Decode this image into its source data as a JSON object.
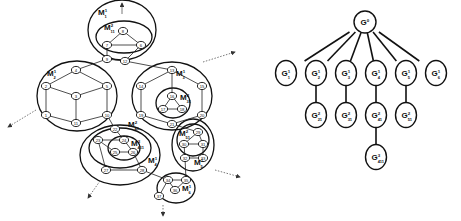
{
  "left_graph": {
    "regions": [
      {
        "id": "M1",
        "label": "M",
        "sup": "1",
        "sub": "1",
        "cx": 122,
        "cy": 30,
        "rx": 34,
        "ry": 30,
        "lx": 98,
        "ly": 15
      },
      {
        "id": "M11",
        "label": "M",
        "sup": "2",
        "sub": "11",
        "cx": 124,
        "cy": 37,
        "rx": 28,
        "ry": 16,
        "lx": 104,
        "ly": 30
      },
      {
        "id": "M2",
        "label": "M",
        "sup": "1",
        "sub": "2",
        "cx": 77,
        "cy": 96,
        "rx": 40,
        "ry": 35,
        "lx": 47,
        "ly": 76
      },
      {
        "id": "M3",
        "label": "M",
        "sup": "1",
        "sub": "3",
        "cx": 172,
        "cy": 96,
        "rx": 40,
        "ry": 34,
        "lx": 176,
        "ly": 76
      },
      {
        "id": "M31",
        "label": "M",
        "sup": "2",
        "sub": "31",
        "cx": 173,
        "cy": 103,
        "rx": 17,
        "ry": 15,
        "lx": 180,
        "ly": 100
      },
      {
        "id": "M4",
        "label": "M",
        "sup": "1",
        "sub": "4",
        "cx": 120,
        "cy": 155,
        "rx": 40,
        "ry": 30,
        "lx": 148,
        "ly": 163
      },
      {
        "id": "M41",
        "label": "M",
        "sup": "2",
        "sub": "41",
        "cx": 120,
        "cy": 148,
        "rx": 31,
        "ry": 20,
        "lx": 128,
        "ly": 127
      },
      {
        "id": "M411",
        "label": "M",
        "sup": "3",
        "sub": "411",
        "cx": 124,
        "cy": 148,
        "rx": 16,
        "ry": 12,
        "lx": 131,
        "ly": 146
      },
      {
        "id": "M5",
        "label": "M",
        "sup": "1",
        "sub": "5",
        "cx": 193,
        "cy": 145,
        "rx": 21,
        "ry": 26,
        "lx": 194,
        "ly": 165
      },
      {
        "id": "M51",
        "label": "M",
        "sup": "2",
        "sub": "51",
        "cx": 193,
        "cy": 140,
        "rx": 16,
        "ry": 16,
        "lx": 179,
        "ly": 136
      },
      {
        "id": "M6",
        "label": "M",
        "sup": "1",
        "sub": "6",
        "cx": 176,
        "cy": 188,
        "rx": 19,
        "ry": 15,
        "lx": 182,
        "ly": 191
      }
    ],
    "nodes": [
      {
        "id": "8",
        "x": 123,
        "y": 31
      },
      {
        "id": "7",
        "x": 107,
        "y": 45
      },
      {
        "id": "6",
        "x": 141,
        "y": 45
      },
      {
        "id": "9",
        "x": 107,
        "y": 59
      },
      {
        "id": "12",
        "x": 125,
        "y": 61
      },
      {
        "id": "4",
        "x": 76,
        "y": 70
      },
      {
        "id": "2",
        "x": 46,
        "y": 86
      },
      {
        "id": "5",
        "x": 107,
        "y": 86
      },
      {
        "id": "3",
        "x": 76,
        "y": 96
      },
      {
        "id": "1",
        "x": 46,
        "y": 115
      },
      {
        "id": "10",
        "x": 107,
        "y": 115
      },
      {
        "id": "11",
        "x": 76,
        "y": 123
      },
      {
        "id": "13",
        "x": 172,
        "y": 70
      },
      {
        "id": "14",
        "x": 141,
        "y": 86
      },
      {
        "id": "15",
        "x": 202,
        "y": 86
      },
      {
        "id": "16",
        "x": 172,
        "y": 96
      },
      {
        "id": "17",
        "x": 163,
        "y": 109
      },
      {
        "id": "18",
        "x": 182,
        "y": 109
      },
      {
        "id": "19",
        "x": 141,
        "y": 115
      },
      {
        "id": "20",
        "x": 202,
        "y": 115
      },
      {
        "id": "21",
        "x": 172,
        "y": 124
      },
      {
        "id": "22",
        "x": 115,
        "y": 129
      },
      {
        "id": "23",
        "x": 98,
        "y": 140
      },
      {
        "id": "24",
        "x": 124,
        "y": 140
      },
      {
        "id": "25",
        "x": 115,
        "y": 152
      },
      {
        "id": "26",
        "x": 133,
        "y": 152
      },
      {
        "id": "27",
        "x": 106,
        "y": 170
      },
      {
        "id": "28",
        "x": 142,
        "y": 170
      },
      {
        "id": "29",
        "x": 198,
        "y": 132
      },
      {
        "id": "30",
        "x": 184,
        "y": 144
      },
      {
        "id": "31",
        "x": 203,
        "y": 144
      },
      {
        "id": "32",
        "x": 185,
        "y": 158
      },
      {
        "id": "33",
        "x": 203,
        "y": 158
      },
      {
        "id": "34",
        "x": 168,
        "y": 180
      },
      {
        "id": "35",
        "x": 186,
        "y": 180
      },
      {
        "id": "36",
        "x": 175,
        "y": 190
      },
      {
        "id": "37",
        "x": 159,
        "y": 196
      }
    ],
    "edges": [
      [
        "8",
        "7"
      ],
      [
        "8",
        "6"
      ],
      [
        "7",
        "6"
      ],
      [
        "7",
        "9"
      ],
      [
        "6",
        "12"
      ],
      [
        "9",
        "12"
      ],
      [
        "9",
        "4"
      ],
      [
        "12",
        "13"
      ],
      [
        "4",
        "2"
      ],
      [
        "4",
        "5"
      ],
      [
        "2",
        "3"
      ],
      [
        "5",
        "3"
      ],
      [
        "2",
        "1"
      ],
      [
        "5",
        "10"
      ],
      [
        "3",
        "11"
      ],
      [
        "1",
        "11"
      ],
      [
        "10",
        "11"
      ],
      [
        "13",
        "14"
      ],
      [
        "13",
        "15"
      ],
      [
        "13",
        "16"
      ],
      [
        "16",
        "17"
      ],
      [
        "16",
        "18"
      ],
      [
        "17",
        "18"
      ],
      [
        "14",
        "19"
      ],
      [
        "15",
        "20"
      ],
      [
        "19",
        "21"
      ],
      [
        "20",
        "21"
      ],
      [
        "10",
        "22"
      ],
      [
        "22",
        "24"
      ],
      [
        "23",
        "24"
      ],
      [
        "23",
        "25"
      ],
      [
        "24",
        "26"
      ],
      [
        "25",
        "26"
      ],
      [
        "23",
        "27"
      ],
      [
        "26",
        "28"
      ],
      [
        "27",
        "28"
      ],
      [
        "21",
        "29"
      ],
      [
        "29",
        "30"
      ],
      [
        "30",
        "31"
      ],
      [
        "29",
        "31"
      ],
      [
        "30",
        "32"
      ],
      [
        "31",
        "33"
      ],
      [
        "32",
        "33"
      ],
      [
        "28",
        "34"
      ],
      [
        "32",
        "35"
      ],
      [
        "34",
        "35"
      ],
      [
        "34",
        "36"
      ],
      [
        "35",
        "36"
      ],
      [
        "34",
        "37"
      ]
    ],
    "arrows": [
      {
        "from": [
          122,
          14
        ],
        "to": [
          122,
          3
        ]
      },
      {
        "from": [
          203,
          62
        ],
        "to": [
          235,
          52
        ]
      },
      {
        "from": [
          36,
          110
        ],
        "to": [
          8,
          127
        ]
      },
      {
        "from": [
          100,
          181
        ],
        "to": [
          88,
          198
        ]
      },
      {
        "from": [
          215,
          170
        ],
        "to": [
          240,
          177
        ]
      },
      {
        "from": [
          163,
          205
        ],
        "to": [
          163,
          216
        ]
      }
    ]
  },
  "tree": {
    "root": {
      "id": "G0",
      "label": "G",
      "sup": "0",
      "sub": "",
      "x": 365,
      "y": 22
    },
    "nodes": [
      {
        "id": "G11",
        "label": "G",
        "sup": "1",
        "sub": "1",
        "x": 286,
        "y": 73,
        "parent": "G0"
      },
      {
        "id": "G12",
        "label": "G",
        "sup": "1",
        "sub": "2",
        "x": 316,
        "y": 73,
        "parent": "G0"
      },
      {
        "id": "G13",
        "label": "G",
        "sup": "1",
        "sub": "3",
        "x": 346,
        "y": 73,
        "parent": "G0"
      },
      {
        "id": "G14",
        "label": "G",
        "sup": "1",
        "sub": "4",
        "x": 376,
        "y": 73,
        "parent": "G0"
      },
      {
        "id": "G15",
        "label": "G",
        "sup": "1",
        "sub": "5",
        "x": 406,
        "y": 73,
        "parent": "G0"
      },
      {
        "id": "G16",
        "label": "G",
        "sup": "1",
        "sub": "6",
        "x": 436,
        "y": 73,
        "parent": "G0"
      },
      {
        "id": "G221",
        "label": "G",
        "sup": "2",
        "sub": "21",
        "x": 316,
        "y": 115,
        "parent": "G12"
      },
      {
        "id": "G231",
        "label": "G",
        "sup": "2",
        "sub": "31",
        "x": 346,
        "y": 115,
        "parent": "G13"
      },
      {
        "id": "G241",
        "label": "G",
        "sup": "2",
        "sub": "41",
        "x": 376,
        "y": 115,
        "parent": "G14"
      },
      {
        "id": "G251",
        "label": "G",
        "sup": "2",
        "sub": "51",
        "x": 406,
        "y": 115,
        "parent": "G15"
      },
      {
        "id": "G3411",
        "label": "G",
        "sup": "3",
        "sub": "411",
        "x": 376,
        "y": 157,
        "parent": "G241"
      }
    ]
  }
}
